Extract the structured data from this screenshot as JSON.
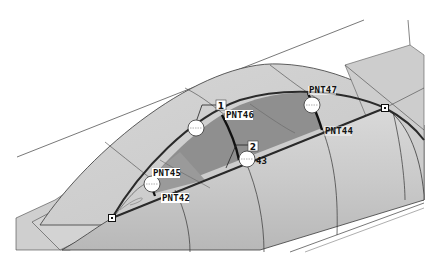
{
  "viewport": {
    "background": "#ffffff",
    "colors": {
      "surface_light": "#d2d2d2",
      "surface_mid": "#c4c4c4",
      "surface_dark": "#a9a9a9",
      "patch_dark": "#8f8f8f",
      "edge": "#3a3a3a",
      "edge_bold": "#1e1e1e",
      "label_bg": "#ffffff"
    }
  },
  "datum_points": [
    {
      "id": "PNT42",
      "label": "PNT42"
    },
    {
      "id": "PNT43",
      "label": "43"
    },
    {
      "id": "PNT44",
      "label": "PNT44"
    },
    {
      "id": "PNT45",
      "label": "PNT45"
    },
    {
      "id": "PNT46",
      "label": "PNT46"
    },
    {
      "id": "PNT47",
      "label": "PNT47"
    }
  ],
  "markers": [
    {
      "id": "marker-1",
      "label": "1"
    },
    {
      "id": "marker-2",
      "label": "2"
    }
  ]
}
